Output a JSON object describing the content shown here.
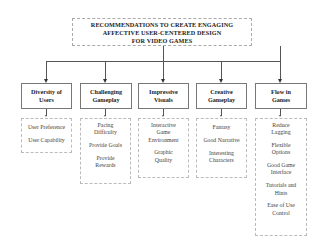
{
  "diagram": {
    "root": {
      "lines": [
        "RECOMMENDATIONS TO CREATE ENGAGING",
        "AFFECTIVE USER-CENTERED DESIGN",
        "FOR VIDEO GAMES"
      ]
    },
    "categories": [
      {
        "title_lines": [
          "Diversity of",
          "Users"
        ],
        "items": [
          "User Preference",
          "User Capability"
        ]
      },
      {
        "title_lines": [
          "Challenging",
          "Gameplay"
        ],
        "items": [
          "Pacing Difficulty",
          "Provide Goals",
          "Provide Rewards"
        ]
      },
      {
        "title_lines": [
          "Impressive",
          "Visuals"
        ],
        "items": [
          "Interactive Game Environment",
          "Graphic Quality"
        ]
      },
      {
        "title_lines": [
          "Creative",
          "Gameplay"
        ],
        "items": [
          "Fantasy",
          "Good Narrative",
          "Interesting Characters"
        ]
      },
      {
        "title_lines": [
          "Flow in",
          "Games"
        ],
        "items": [
          "Reduce Lagging",
          "Flexible Options",
          "Good Game Interface",
          "Tutorials and Hints",
          "Ease of Use Control"
        ]
      }
    ]
  }
}
